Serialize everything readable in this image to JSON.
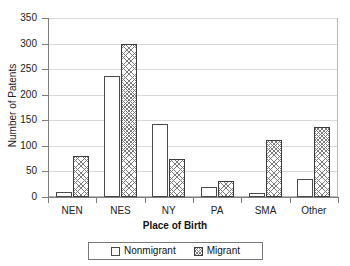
{
  "chart_data": {
    "type": "bar",
    "title": "",
    "xlabel": "Place of Birth",
    "ylabel": "Number of Patents",
    "categories": [
      "NEN",
      "NES",
      "NY",
      "PA",
      "SMA",
      "Other"
    ],
    "series": [
      {
        "name": "Nonmigrant",
        "values": [
          10,
          237,
          143,
          20,
          8,
          35
        ]
      },
      {
        "name": "Migrant",
        "values": [
          80,
          300,
          75,
          32,
          112,
          137
        ]
      }
    ],
    "ylim": [
      0,
      350
    ],
    "yticks": [
      0,
      50,
      100,
      150,
      200,
      250,
      300,
      350
    ],
    "ytick_labels": [
      "0",
      "50",
      "100",
      "150",
      "200",
      "250",
      "300",
      "350"
    ],
    "grid": true,
    "grid_axis": "y",
    "legend_position": "bottom",
    "legend": [
      {
        "label": "Nonmigrant",
        "swatch": "open-square-swatch"
      },
      {
        "label": "Migrant",
        "swatch": "hatched-square-swatch"
      }
    ],
    "colors": {
      "nonmigrant_fill": "#ffffff",
      "nonmigrant_edge": "#4a4a4a",
      "migrant_hatch": "#7c7c7c",
      "migrant_edge": "#3d3d3d",
      "gridline": "#d9d9d9",
      "axis": "#7d7d7d",
      "background": "#ffffff"
    }
  }
}
